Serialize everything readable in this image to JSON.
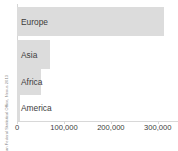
{
  "source": {
    "text": "Source: German Federal Statistical Office, Nexus 2013"
  },
  "axis": {
    "ticks": [
      {
        "label": "0",
        "value": 0
      },
      {
        "label": "100,000",
        "value": 100000
      },
      {
        "label": "200,000",
        "value": 200000
      },
      {
        "label": "300,000",
        "value": 300000
      }
    ]
  },
  "colors": {
    "bar": "#dcdcdc",
    "axis": "#d8d8d8",
    "text": "#3c3c3c",
    "source_text": "#8a8a8a",
    "background": "#ffffff"
  },
  "chart_data": {
    "type": "bar",
    "orientation": "horizontal",
    "title": "",
    "xlabel": "",
    "ylabel": "",
    "categories": [
      "Europe",
      "Asia",
      "Africa",
      "America"
    ],
    "values": [
      313000,
      70000,
      51000,
      3000
    ],
    "xlim": [
      0,
      343000
    ],
    "xticks": [
      0,
      100000,
      200000,
      300000
    ],
    "xticklabels": [
      "0",
      "100,000",
      "200,000",
      "300,000"
    ],
    "grid": false,
    "legend": null,
    "source": "Source: German Federal Statistical Office, Nexus 2013"
  }
}
